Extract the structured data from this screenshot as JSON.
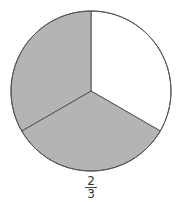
{
  "figure": {
    "shape": "circle",
    "total_parts": 3,
    "shaded_parts": 2,
    "colors": {
      "shaded": "#b4b4b4",
      "unshaded": "#ffffff",
      "outline": "#555555"
    },
    "sectors": [
      {
        "index": 0,
        "start_deg": -90,
        "end_deg": 30,
        "shaded": false
      },
      {
        "index": 1,
        "start_deg": 30,
        "end_deg": 150,
        "shaded": true
      },
      {
        "index": 2,
        "start_deg": 150,
        "end_deg": 270,
        "shaded": true
      }
    ]
  },
  "label": {
    "numerator": "2",
    "denominator": "3"
  }
}
